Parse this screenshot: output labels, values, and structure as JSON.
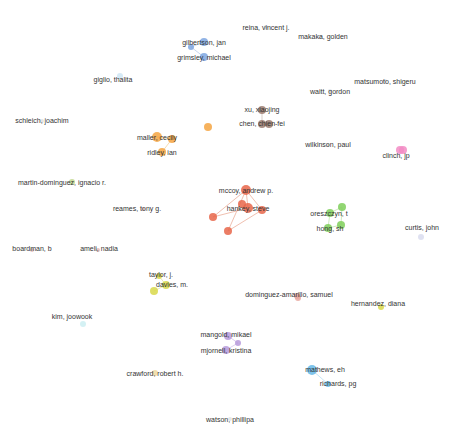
{
  "network": {
    "nodes": [
      {
        "label": "reina, vincent j.",
        "x": 266,
        "y": 27,
        "r": 2,
        "color": "#d8dde8",
        "lx": 266,
        "ly": 27
      },
      {
        "label": "makaka, golden",
        "x": 320,
        "y": 37,
        "r": 2,
        "color": "#d8dde8",
        "lx": 323,
        "ly": 36
      },
      {
        "label": "gilbertson, jan",
        "x": 204,
        "y": 42,
        "r": 4,
        "color": "#7ea6e0",
        "lx": 204,
        "ly": 42
      },
      {
        "label": "grimsley, michael",
        "x": 204,
        "y": 57,
        "r": 4,
        "color": "#7ea6e0",
        "lx": 204,
        "ly": 57
      },
      {
        "label": "giglio, thalita",
        "x": 120,
        "y": 76,
        "r": 3,
        "color": "#cfe6f5",
        "lx": 113,
        "ly": 79
      },
      {
        "label": "matsumoto, shigeru",
        "x": 385,
        "y": 81,
        "r": 2,
        "color": "#dde3ea",
        "lx": 385,
        "ly": 81
      },
      {
        "label": "waitt, gordon",
        "x": 330,
        "y": 91,
        "r": 2,
        "color": "#dde3ea",
        "lx": 330,
        "ly": 91
      },
      {
        "label": "schleich, joachim",
        "x": 42,
        "y": 121,
        "r": 2,
        "color": "#e0e0e0",
        "lx": 42,
        "ly": 120
      },
      {
        "label": "xu, xiaojing",
        "x": 262,
        "y": 110,
        "r": 4,
        "color": "#9b7b6e",
        "lx": 262,
        "ly": 109
      },
      {
        "label": "chen, chien-fei",
        "x": 262,
        "y": 124,
        "r": 4,
        "color": "#9b7b6e",
        "lx": 262,
        "ly": 123
      },
      {
        "label": "maller, cecily",
        "x": 157,
        "y": 137,
        "r": 5,
        "color": "#f5a542",
        "lx": 157,
        "ly": 137
      },
      {
        "label": "ridley, ian",
        "x": 162,
        "y": 152,
        "r": 4,
        "color": "#f5a542",
        "lx": 162,
        "ly": 152
      },
      {
        "label": "wilkinson, paul",
        "x": 328,
        "y": 145,
        "r": 2,
        "color": "#e0e0e0",
        "lx": 328,
        "ly": 144
      },
      {
        "label": "clinch, jp",
        "x": 400,
        "y": 150,
        "r": 4,
        "color": "#f28cc4",
        "lx": 396,
        "ly": 155
      },
      {
        "label": "martin-dominguez, ignacio r.",
        "x": 72,
        "y": 182,
        "r": 3,
        "color": "#c2d88f",
        "lx": 62,
        "ly": 182
      },
      {
        "label": "mccoy, andrew p.",
        "x": 246,
        "y": 190,
        "r": 5,
        "color": "#e8664a",
        "lx": 246,
        "ly": 190
      },
      {
        "label": "hankey, steve",
        "x": 248,
        "y": 208,
        "r": 5,
        "color": "#e8664a",
        "lx": 248,
        "ly": 208
      },
      {
        "label": "reames, tony g.",
        "x": 143,
        "y": 209,
        "r": 2,
        "color": "#e0c0c0",
        "lx": 137,
        "ly": 208
      },
      {
        "label": "oreszczyn, t",
        "x": 330,
        "y": 213,
        "r": 4,
        "color": "#7fcf5a",
        "lx": 329,
        "ly": 213
      },
      {
        "label": "hong, sh",
        "x": 328,
        "y": 228,
        "r": 4,
        "color": "#7fcf5a",
        "lx": 330,
        "ly": 228
      },
      {
        "label": "curtis, john",
        "x": 421,
        "y": 237,
        "r": 3,
        "color": "#d9dcef",
        "lx": 422,
        "ly": 227
      },
      {
        "label": "boardman, b",
        "x": 32,
        "y": 250,
        "r": 2,
        "color": "#e0b8b8",
        "lx": 32,
        "ly": 248
      },
      {
        "label": "ameli, nadia",
        "x": 98,
        "y": 250,
        "r": 2,
        "color": "#e0b8b8",
        "lx": 99,
        "ly": 248
      },
      {
        "label": "taylor, j.",
        "x": 159,
        "y": 276,
        "r": 3,
        "color": "#d8d84a",
        "lx": 161,
        "ly": 274
      },
      {
        "label": "davies, m.",
        "x": 166,
        "y": 285,
        "r": 4,
        "color": "#d8d84a",
        "lx": 172,
        "ly": 284
      },
      {
        "label": "dominguez-amarillo, samuel",
        "x": 297,
        "y": 296,
        "r": 3,
        "color": "#e8a8a0",
        "lx": 289,
        "ly": 294
      },
      {
        "label": "hernandez, diana",
        "x": 381,
        "y": 307,
        "r": 3,
        "color": "#d8d84a",
        "lx": 378,
        "ly": 303
      },
      {
        "label": "kim, joowook",
        "x": 83,
        "y": 324,
        "r": 3,
        "color": "#cdeff2",
        "lx": 72,
        "ly": 316
      },
      {
        "label": "mangold, mikael",
        "x": 228,
        "y": 336,
        "r": 4,
        "color": "#b69adb",
        "lx": 226,
        "ly": 334
      },
      {
        "label": "mjornell, kristina",
        "x": 226,
        "y": 350,
        "r": 4,
        "color": "#b69adb",
        "lx": 226,
        "ly": 350
      },
      {
        "label": "crawford, robert h.",
        "x": 155,
        "y": 373,
        "r": 3,
        "color": "#f0d8a0",
        "lx": 155,
        "ly": 373
      },
      {
        "label": "mathews, eh",
        "x": 312,
        "y": 370,
        "r": 5,
        "color": "#66b8e8",
        "lx": 325,
        "ly": 369
      },
      {
        "label": "richards, pg",
        "x": 328,
        "y": 384,
        "r": 3,
        "color": "#66b8e8",
        "lx": 338,
        "ly": 383
      },
      {
        "label": "watson, phillipa",
        "x": 230,
        "y": 419,
        "r": 2,
        "color": "#e0e0e0",
        "lx": 230,
        "ly": 419
      }
    ],
    "extra_nodes": [
      {
        "x": 191,
        "y": 47,
        "r": 3,
        "color": "#7ea6e0"
      },
      {
        "x": 208,
        "y": 127,
        "r": 4,
        "color": "#f5a542"
      },
      {
        "x": 172,
        "y": 139,
        "r": 4,
        "color": "#f5a542"
      },
      {
        "x": 269,
        "y": 124,
        "r": 4,
        "color": "#9b7b6e"
      },
      {
        "x": 213,
        "y": 217,
        "r": 4,
        "color": "#e8664a"
      },
      {
        "x": 228,
        "y": 231,
        "r": 4,
        "color": "#e8664a"
      },
      {
        "x": 262,
        "y": 210,
        "r": 4,
        "color": "#e8664a"
      },
      {
        "x": 242,
        "y": 204,
        "r": 4,
        "color": "#e8664a"
      },
      {
        "x": 342,
        "y": 207,
        "r": 4,
        "color": "#7fcf5a"
      },
      {
        "x": 341,
        "y": 225,
        "r": 4,
        "color": "#7fcf5a"
      },
      {
        "x": 154,
        "y": 291,
        "r": 4,
        "color": "#d8d84a"
      },
      {
        "x": 298,
        "y": 298,
        "r": 3,
        "color": "#e8a8a0"
      },
      {
        "x": 238,
        "y": 343,
        "r": 3,
        "color": "#b69adb"
      },
      {
        "x": 403,
        "y": 150,
        "r": 4,
        "color": "#f28cc4"
      }
    ],
    "edges": [
      [
        246,
        190,
        248,
        208,
        "#f0c0b0"
      ],
      [
        213,
        217,
        248,
        208,
        "#f0c0b0"
      ],
      [
        228,
        231,
        246,
        190,
        "#f0c0b0"
      ],
      [
        262,
        210,
        246,
        190,
        "#f0c0b0"
      ],
      [
        213,
        217,
        246,
        190,
        "#f0c0b0"
      ],
      [
        228,
        231,
        262,
        210,
        "#f0c0b0"
      ],
      [
        330,
        213,
        342,
        207,
        "#cfeabf"
      ],
      [
        328,
        228,
        341,
        225,
        "#cfeabf"
      ],
      [
        330,
        213,
        328,
        228,
        "#cfeabf"
      ],
      [
        342,
        207,
        341,
        225,
        "#cfeabf"
      ],
      [
        204,
        42,
        191,
        47,
        "#c8d8f0"
      ],
      [
        191,
        47,
        204,
        57,
        "#c8d8f0"
      ],
      [
        157,
        137,
        172,
        139,
        "#f8dcb0"
      ],
      [
        162,
        152,
        172,
        139,
        "#f8dcb0"
      ],
      [
        262,
        110,
        262,
        124,
        "#d8cfca"
      ],
      [
        262,
        124,
        269,
        124,
        "#d8cfca"
      ],
      [
        159,
        276,
        166,
        285,
        "#ececb0"
      ],
      [
        154,
        291,
        166,
        285,
        "#ececb0"
      ],
      [
        228,
        336,
        238,
        343,
        "#ddd0f0"
      ],
      [
        226,
        350,
        238,
        343,
        "#ddd0f0"
      ],
      [
        312,
        370,
        328,
        384,
        "#c8e6f6"
      ]
    ]
  }
}
